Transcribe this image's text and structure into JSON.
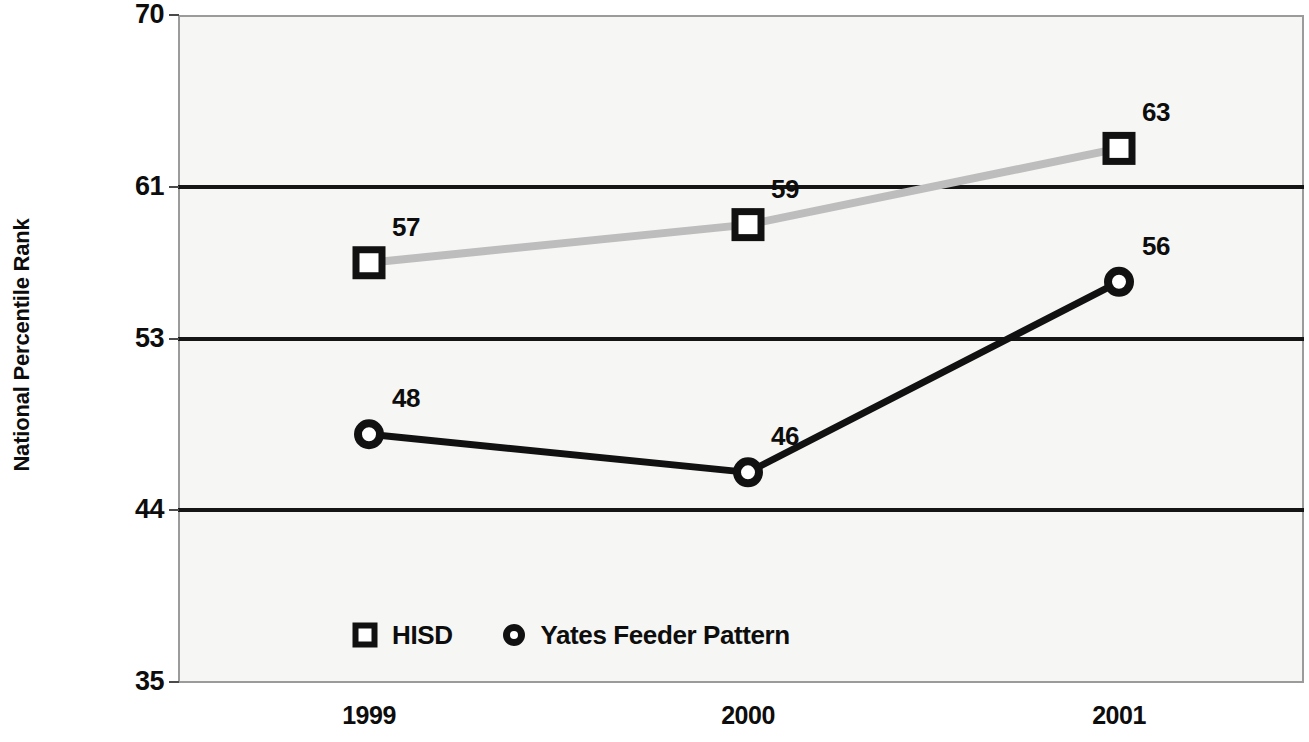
{
  "chart_data": {
    "type": "line",
    "title": "",
    "xlabel": "",
    "ylabel": "National Percentile Rank",
    "categories": [
      "1999",
      "2000",
      "2001"
    ],
    "ylim": [
      35,
      70
    ],
    "yticks": [
      "35",
      "44",
      "53",
      "61",
      "70"
    ],
    "ytick_values": [
      35,
      44,
      53,
      61,
      70
    ],
    "grid": "horizontal",
    "legend_position": "bottom-inside",
    "series": [
      {
        "name": "HISD",
        "marker": "square",
        "color": "#bdbdbd",
        "values": [
          57,
          59,
          63
        ],
        "labels": [
          "57",
          "59",
          "63"
        ]
      },
      {
        "name": "Yates Feeder Pattern",
        "marker": "circle",
        "color": "#111111",
        "values": [
          48,
          46,
          56
        ],
        "labels": [
          "48",
          "46",
          "56"
        ]
      }
    ]
  },
  "axis": {
    "y_title": "National Percentile Rank",
    "y_ticks": [
      {
        "label": "70",
        "value": 70
      },
      {
        "label": "61",
        "value": 61
      },
      {
        "label": "53",
        "value": 53
      },
      {
        "label": "44",
        "value": 44
      },
      {
        "label": "35",
        "value": 35
      }
    ],
    "x_ticks": [
      {
        "label": "1999"
      },
      {
        "label": "2000"
      },
      {
        "label": "2001"
      }
    ]
  },
  "legend": {
    "entries": [
      {
        "label": "HISD",
        "marker": "square-marker-icon"
      },
      {
        "label": "Yates Feeder Pattern",
        "marker": "circle-marker-icon"
      }
    ]
  },
  "colors": {
    "hisd_line": "#bdbdbd",
    "yates_line": "#111111",
    "gridline": "#151515",
    "frame": "#9b9b9b",
    "plot_background": "#f6f6f4",
    "text": "#0d0d0d"
  }
}
